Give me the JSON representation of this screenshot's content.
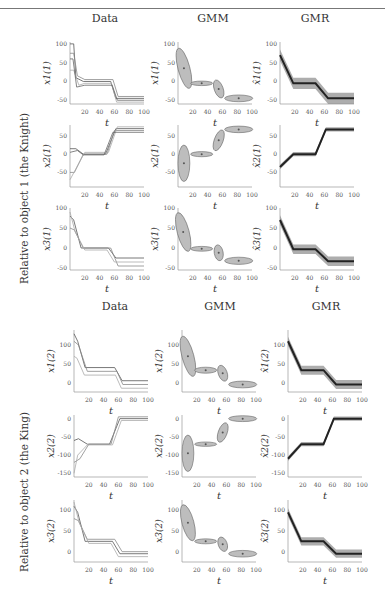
{
  "column_titles": [
    "Data",
    "GMM",
    "GMR"
  ],
  "row_groups": [
    {
      "label": "Relative to object 1 (the Knight)",
      "sup": "(1)"
    },
    {
      "label": "Relative to object 2 (the King)",
      "sup": "(2)"
    }
  ],
  "xlabel": "t",
  "x_ticks": [
    20,
    40,
    60,
    80,
    100
  ],
  "colors": {
    "ellipse_fill": "#bdbdbd",
    "ellipse_stroke": "#666666",
    "gmr_band": "#8a8a8a",
    "gmr_line": "#222222",
    "data_line": "#777777"
  },
  "chart_data": [
    {
      "type": "line",
      "group": 1,
      "col": "Data",
      "ylabel": "x_1^(1)",
      "yticks": [
        -50,
        0,
        50,
        100
      ],
      "ylim": [
        -60,
        105
      ],
      "series": [
        {
          "x": [
            0,
            5,
            8,
            18,
            55,
            62,
            100
          ],
          "y": [
            100,
            100,
            10,
            0,
            0,
            -45,
            -45
          ]
        },
        {
          "x": [
            0,
            5,
            10,
            20,
            58,
            65,
            100
          ],
          "y": [
            75,
            75,
            15,
            5,
            5,
            -40,
            -40
          ]
        },
        {
          "x": [
            0,
            5,
            12,
            20,
            56,
            63,
            100
          ],
          "y": [
            30,
            30,
            -10,
            -5,
            -5,
            -55,
            -55
          ]
        },
        {
          "x": [
            0,
            4,
            9,
            20,
            57,
            64,
            100
          ],
          "y": [
            60,
            60,
            -15,
            -10,
            -10,
            -50,
            -50
          ]
        }
      ]
    },
    {
      "type": "ellipse",
      "group": 1,
      "col": "GMM",
      "ylabel": "x_1^(1)",
      "yticks": [
        -50,
        0,
        50,
        100
      ],
      "ylim": [
        -60,
        105
      ],
      "components": [
        {
          "cx": 8,
          "cy": 35,
          "rx": 8,
          "ry": 55,
          "rot": -15
        },
        {
          "cx": 32,
          "cy": -5,
          "rx": 15,
          "ry": 6,
          "rot": 0
        },
        {
          "cx": 55,
          "cy": -20,
          "rx": 6,
          "ry": 25,
          "rot": -20
        },
        {
          "cx": 82,
          "cy": -45,
          "rx": 19,
          "ry": 9,
          "rot": 0
        }
      ]
    },
    {
      "type": "line",
      "group": 1,
      "col": "GMR",
      "ylabel": "x̂_1^(1)",
      "yticks": [
        -50,
        0,
        50,
        100
      ],
      "ylim": [
        -60,
        105
      ],
      "mean": {
        "x": [
          0,
          18,
          48,
          65,
          100
        ],
        "y": [
          70,
          -5,
          -5,
          -45,
          -45
        ]
      },
      "band": 15
    },
    {
      "type": "line",
      "group": 1,
      "col": "Data",
      "ylabel": "x_2^(1)",
      "yticks": [
        -50,
        0,
        50
      ],
      "ylim": [
        -90,
        80
      ],
      "series": [
        {
          "x": [
            0,
            8,
            18,
            48,
            62,
            100
          ],
          "y": [
            15,
            15,
            0,
            0,
            70,
            70
          ]
        },
        {
          "x": [
            0,
            6,
            18,
            50,
            60,
            100
          ],
          "y": [
            -50,
            -50,
            0,
            0,
            65,
            65
          ]
        },
        {
          "x": [
            0,
            8,
            20,
            52,
            64,
            100
          ],
          "y": [
            -70,
            -40,
            5,
            5,
            75,
            75
          ]
        },
        {
          "x": [
            0,
            10,
            18,
            46,
            58,
            100
          ],
          "y": [
            5,
            10,
            -2,
            -2,
            60,
            60
          ]
        }
      ]
    },
    {
      "type": "ellipse",
      "group": 1,
      "col": "GMM",
      "ylabel": "x_2^(1)",
      "yticks": [
        -50,
        0,
        50
      ],
      "ylim": [
        -90,
        80
      ],
      "components": [
        {
          "cx": 8,
          "cy": -25,
          "rx": 8,
          "ry": 50,
          "rot": 0
        },
        {
          "cx": 32,
          "cy": 0,
          "rx": 15,
          "ry": 7,
          "rot": 0
        },
        {
          "cx": 55,
          "cy": 38,
          "rx": 6,
          "ry": 30,
          "rot": 20
        },
        {
          "cx": 82,
          "cy": 68,
          "rx": 19,
          "ry": 9,
          "rot": 0
        }
      ]
    },
    {
      "type": "line",
      "group": 1,
      "col": "GMR",
      "ylabel": "x̂_2^(1)",
      "yticks": [
        -50,
        0,
        50
      ],
      "ylim": [
        -90,
        80
      ],
      "mean": {
        "x": [
          0,
          18,
          48,
          62,
          100
        ],
        "y": [
          -35,
          0,
          0,
          68,
          68
        ]
      },
      "band": 6
    },
    {
      "type": "line",
      "group": 1,
      "col": "Data",
      "ylabel": "x_3^(1)",
      "yticks": [
        -50,
        0,
        50,
        100
      ],
      "ylim": [
        -55,
        100
      ],
      "series": [
        {
          "x": [
            0,
            5,
            15,
            52,
            62,
            100
          ],
          "y": [
            80,
            70,
            0,
            0,
            -25,
            -25
          ]
        },
        {
          "x": [
            0,
            6,
            18,
            55,
            65,
            100
          ],
          "y": [
            50,
            45,
            0,
            0,
            -45,
            -45
          ]
        },
        {
          "x": [
            0,
            7,
            20,
            50,
            60,
            100
          ],
          "y": [
            90,
            40,
            -5,
            -5,
            -35,
            -35
          ]
        }
      ]
    },
    {
      "type": "ellipse",
      "group": 1,
      "col": "GMM",
      "ylabel": "x_3^(1)",
      "yticks": [
        -50,
        0,
        50,
        100
      ],
      "ylim": [
        -55,
        100
      ],
      "components": [
        {
          "cx": 7,
          "cy": 40,
          "rx": 8,
          "ry": 50,
          "rot": -15
        },
        {
          "cx": 32,
          "cy": -2,
          "rx": 15,
          "ry": 6,
          "rot": 0
        },
        {
          "cx": 55,
          "cy": -12,
          "rx": 6,
          "ry": 20,
          "rot": -10
        },
        {
          "cx": 82,
          "cy": -32,
          "rx": 19,
          "ry": 9,
          "rot": 0
        }
      ]
    },
    {
      "type": "line",
      "group": 1,
      "col": "GMR",
      "ylabel": "x̂_3^(1)",
      "yticks": [
        -50,
        0,
        50,
        100
      ],
      "ylim": [
        -55,
        100
      ],
      "mean": {
        "x": [
          0,
          18,
          48,
          65,
          100
        ],
        "y": [
          70,
          -3,
          -3,
          -33,
          -33
        ]
      },
      "band": 12
    },
    {
      "type": "line",
      "group": 2,
      "col": "Data",
      "ylabel": "x_1^(2)",
      "yticks": [
        0,
        50,
        100
      ],
      "ylim": [
        -25,
        140
      ],
      "series": [
        {
          "x": [
            0,
            5,
            15,
            55,
            65,
            100
          ],
          "y": [
            130,
            110,
            40,
            40,
            5,
            5
          ]
        },
        {
          "x": [
            0,
            6,
            18,
            58,
            66,
            100
          ],
          "y": [
            110,
            100,
            30,
            30,
            -5,
            -5
          ]
        },
        {
          "x": [
            0,
            4,
            14,
            56,
            64,
            100
          ],
          "y": [
            70,
            65,
            20,
            20,
            -15,
            -15
          ]
        }
      ]
    },
    {
      "type": "ellipse",
      "group": 2,
      "col": "GMM",
      "ylabel": "x_1^(2)",
      "yticks": [
        0,
        50,
        100
      ],
      "ylim": [
        -25,
        140
      ],
      "components": [
        {
          "cx": 8,
          "cy": 70,
          "rx": 8,
          "ry": 55,
          "rot": -15
        },
        {
          "cx": 32,
          "cy": 33,
          "rx": 15,
          "ry": 8,
          "rot": 0
        },
        {
          "cx": 55,
          "cy": 25,
          "rx": 6,
          "ry": 22,
          "rot": -20
        },
        {
          "cx": 82,
          "cy": -5,
          "rx": 19,
          "ry": 9,
          "rot": 0
        }
      ]
    },
    {
      "type": "line",
      "group": 2,
      "col": "GMR",
      "ylabel": "x̂_1^(2)",
      "yticks": [
        0,
        50,
        100
      ],
      "ylim": [
        -25,
        140
      ],
      "mean": {
        "x": [
          0,
          18,
          48,
          65,
          100
        ],
        "y": [
          110,
          33,
          33,
          -5,
          -5
        ]
      },
      "band": 12
    },
    {
      "type": "line",
      "group": 2,
      "col": "Data",
      "ylabel": "x_2^(2)",
      "yticks": [
        -150,
        -100,
        -50,
        0
      ],
      "ylim": [
        -160,
        10
      ],
      "series": [
        {
          "x": [
            0,
            6,
            18,
            48,
            62,
            100
          ],
          "y": [
            -60,
            -55,
            -70,
            -70,
            0,
            0
          ]
        },
        {
          "x": [
            0,
            8,
            20,
            50,
            60,
            100
          ],
          "y": [
            -120,
            -110,
            -70,
            -70,
            5,
            5
          ]
        },
        {
          "x": [
            0,
            5,
            18,
            52,
            64,
            100
          ],
          "y": [
            -150,
            -100,
            -72,
            -72,
            -5,
            -5
          ]
        }
      ]
    },
    {
      "type": "ellipse",
      "group": 2,
      "col": "GMM",
      "ylabel": "x_2^(2)",
      "yticks": [
        -150,
        -100,
        -50,
        0
      ],
      "ylim": [
        -160,
        10
      ],
      "components": [
        {
          "cx": 8,
          "cy": -95,
          "rx": 8,
          "ry": 50,
          "rot": 0
        },
        {
          "cx": 32,
          "cy": -70,
          "rx": 15,
          "ry": 6,
          "rot": 0
        },
        {
          "cx": 55,
          "cy": -38,
          "rx": 6,
          "ry": 28,
          "rot": 20
        },
        {
          "cx": 82,
          "cy": 0,
          "rx": 19,
          "ry": 8,
          "rot": 0
        }
      ]
    },
    {
      "type": "line",
      "group": 2,
      "col": "GMR",
      "ylabel": "x̂_2^(2)",
      "yticks": [
        -150,
        -100,
        -50,
        0
      ],
      "ylim": [
        -160,
        10
      ],
      "mean": {
        "x": [
          0,
          18,
          48,
          62,
          100
        ],
        "y": [
          -110,
          -70,
          -70,
          0,
          0
        ]
      },
      "band": 6
    },
    {
      "type": "line",
      "group": 2,
      "col": "Data",
      "ylabel": "x_3^(2)",
      "yticks": [
        0,
        50,
        100
      ],
      "ylim": [
        -25,
        125
      ],
      "series": [
        {
          "x": [
            0,
            5,
            15,
            52,
            62,
            100
          ],
          "y": [
            110,
            95,
            25,
            25,
            -5,
            -5
          ]
        },
        {
          "x": [
            0,
            6,
            18,
            55,
            65,
            100
          ],
          "y": [
            80,
            75,
            30,
            30,
            0,
            0
          ]
        },
        {
          "x": [
            0,
            7,
            20,
            50,
            60,
            100
          ],
          "y": [
            120,
            70,
            20,
            20,
            -12,
            -12
          ]
        }
      ]
    },
    {
      "type": "ellipse",
      "group": 2,
      "col": "GMM",
      "ylabel": "x_3^(2)",
      "yticks": [
        0,
        50,
        100
      ],
      "ylim": [
        -25,
        125
      ],
      "components": [
        {
          "cx": 8,
          "cy": 70,
          "rx": 8,
          "ry": 45,
          "rot": -15
        },
        {
          "cx": 32,
          "cy": 25,
          "rx": 15,
          "ry": 6,
          "rot": 0
        },
        {
          "cx": 55,
          "cy": 18,
          "rx": 6,
          "ry": 18,
          "rot": -20
        },
        {
          "cx": 82,
          "cy": -5,
          "rx": 19,
          "ry": 8,
          "rot": 0
        }
      ]
    },
    {
      "type": "line",
      "group": 2,
      "col": "GMR",
      "ylabel": "x̂_3^(2)",
      "yticks": [
        0,
        50,
        100
      ],
      "ylim": [
        -25,
        125
      ],
      "mean": {
        "x": [
          0,
          18,
          48,
          65,
          100
        ],
        "y": [
          95,
          25,
          25,
          -5,
          -5
        ]
      },
      "band": 10
    }
  ]
}
